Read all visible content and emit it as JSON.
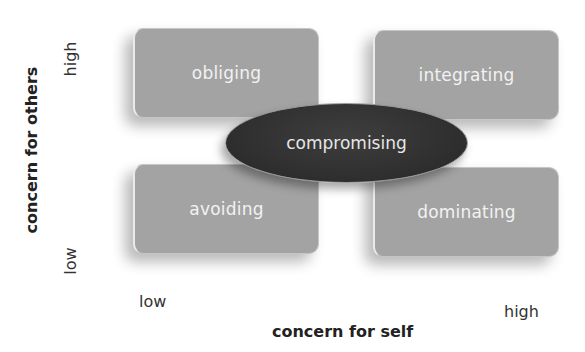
{
  "diagram": {
    "type": "2x2 conflict style grid",
    "quadrants": {
      "top_left": "obliging",
      "top_right": "integrating",
      "bottom_left": "avoiding",
      "bottom_right": "dominating"
    },
    "center": "compromising",
    "y_axis": {
      "title": "concern for others",
      "high": "high",
      "low": "low"
    },
    "x_axis": {
      "title": "concern for self",
      "low": "low",
      "high": "high"
    },
    "colors": {
      "box_fill": "#a3a3a3",
      "box_text": "#f2f2f2",
      "center_fill": "#303030",
      "center_text": "#e6e6e6",
      "axis_text": "#222222"
    }
  }
}
